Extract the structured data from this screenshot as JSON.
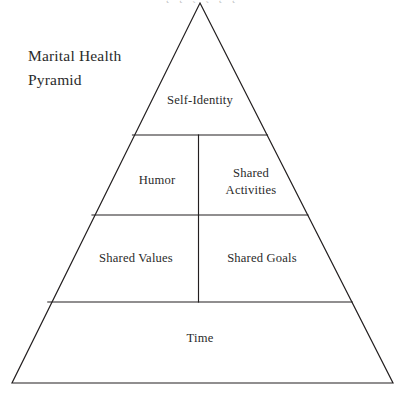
{
  "diagram": {
    "type": "pyramid",
    "title": "Marital Health\nPyramid",
    "title_lines": [
      "Marital Health",
      "Pyramid"
    ],
    "stroke_color": "#231f20",
    "fill_color": "#ffffff",
    "text_color": "#2b2b2b",
    "background": "#ffffff",
    "apex": {
      "x": 200,
      "y": 3
    },
    "base_left": {
      "x": 12,
      "y": 383
    },
    "base_right": {
      "x": 393,
      "y": 383
    },
    "tier_divider_y": [
      135,
      215,
      302
    ],
    "vertical_divider_x": 198,
    "tiers": [
      {
        "level": 1,
        "name": "apex-tier",
        "cells": [
          {
            "label": "Self-Identity"
          }
        ]
      },
      {
        "level": 2,
        "name": "second-tier",
        "cells": [
          {
            "label": "Humor"
          },
          {
            "label": "Shared\nActivities"
          }
        ]
      },
      {
        "level": 3,
        "name": "third-tier",
        "cells": [
          {
            "label": "Shared Values"
          },
          {
            "label": "Shared Goals"
          }
        ]
      },
      {
        "level": 4,
        "name": "base-tier",
        "cells": [
          {
            "label": "Time"
          }
        ]
      }
    ],
    "cropped_header_text": "˛ ˛ ˏ ˏ ˛ ˛"
  }
}
